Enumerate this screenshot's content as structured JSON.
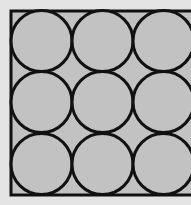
{
  "diagram": {
    "colors": {
      "background": "#e4e4e4",
      "fill": "#c2c2c2",
      "stroke": "#111111"
    },
    "square": {
      "x": 11,
      "y": 11,
      "size": 184,
      "stroke_width": 3
    },
    "grid": {
      "rows": 3,
      "cols": 3
    },
    "circles": [
      {
        "row": 0,
        "col": 0,
        "cx": 41.5,
        "cy": 41,
        "r": 30.5
      },
      {
        "row": 0,
        "col": 1,
        "cx": 102.5,
        "cy": 41,
        "r": 30.5
      },
      {
        "row": 0,
        "col": 2,
        "cx": 163.5,
        "cy": 41,
        "r": 30.5
      },
      {
        "row": 1,
        "col": 0,
        "cx": 41.5,
        "cy": 102,
        "r": 30.5
      },
      {
        "row": 1,
        "col": 1,
        "cx": 102.5,
        "cy": 102,
        "r": 30.5
      },
      {
        "row": 1,
        "col": 2,
        "cx": 163.5,
        "cy": 102,
        "r": 30.5
      },
      {
        "row": 2,
        "col": 0,
        "cx": 41.5,
        "cy": 164,
        "r": 30.5
      },
      {
        "row": 2,
        "col": 1,
        "cx": 102.5,
        "cy": 164,
        "r": 30.5
      },
      {
        "row": 2,
        "col": 2,
        "cx": 163.5,
        "cy": 164,
        "r": 30.5
      }
    ]
  }
}
